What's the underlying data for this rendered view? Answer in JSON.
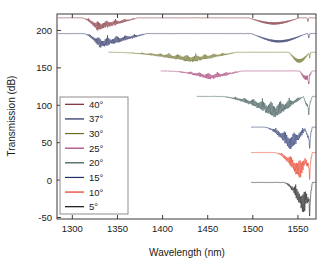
{
  "figure": {
    "background": "#ffffff",
    "frame_color": "#3a3a3a"
  },
  "chart_data": {
    "type": "line",
    "title": "",
    "xlabel": "Wavelength (nm)",
    "ylabel": "Transmission (dB)",
    "xlim": [
      1283,
      1570
    ],
    "ylim": [
      -52,
      222
    ],
    "xticks": [
      1300,
      1350,
      1400,
      1450,
      1500,
      1550
    ],
    "yticks": [
      -50,
      0,
      50,
      100,
      150,
      200
    ],
    "grid": false,
    "legend_position": "center-left",
    "series": [
      {
        "name": "40°",
        "label": "40°",
        "color": "#7a2630",
        "baseline_db": 217,
        "start_nm": 1284,
        "comb_start_nm": 1310,
        "comb_end_nm": 1372,
        "comb_peak_nm": 1327,
        "comb_depth_db": 15,
        "envelope_start_nm": 1495,
        "envelope_end_nm": 1552,
        "envelope_center_nm": 1524,
        "envelope_depth_db": 9,
        "bragg_nm": 1561,
        "bragg_depth_db": 5
      },
      {
        "name": "37°",
        "label": "37°",
        "color": "#20275c",
        "baseline_db": 196,
        "start_nm": 1284,
        "comb_start_nm": 1312,
        "comb_end_nm": 1382,
        "comb_peak_nm": 1330,
        "comb_depth_db": 17,
        "envelope_start_nm": 1498,
        "envelope_end_nm": 1560,
        "envelope_center_nm": 1535,
        "envelope_depth_db": 12,
        "bragg_nm": 1562,
        "bragg_depth_db": 6
      },
      {
        "name": "30°",
        "label": "30°",
        "color": "#6b6d23",
        "baseline_db": 171,
        "start_nm": 1340,
        "comb_start_nm": 1345,
        "comb_end_nm": 1482,
        "comb_peak_nm": 1432,
        "comb_depth_db": 12,
        "envelope_start_nm": 1540,
        "envelope_end_nm": 1563,
        "envelope_center_nm": 1556,
        "envelope_depth_db": 14,
        "bragg_nm": 1563,
        "bragg_depth_db": 8
      },
      {
        "name": "25°",
        "label": "25°",
        "color": "#a33a72",
        "baseline_db": 146,
        "start_nm": 1398,
        "comb_start_nm": 1404,
        "comb_end_nm": 1488,
        "comb_peak_nm": 1452,
        "comb_depth_db": 10,
        "envelope_start_nm": 1552,
        "envelope_end_nm": 1566,
        "envelope_center_nm": 1561,
        "envelope_depth_db": 12,
        "bragg_nm": 1562,
        "bragg_depth_db": 10
      },
      {
        "name": "20°",
        "label": "20°",
        "color": "#33514f",
        "baseline_db": 112,
        "start_nm": 1438,
        "comb_start_nm": 1462,
        "comb_end_nm": 1556,
        "comb_peak_nm": 1524,
        "comb_depth_db": 25,
        "envelope_start_nm": 1556,
        "envelope_end_nm": 1566,
        "envelope_center_nm": 1561,
        "envelope_depth_db": 14,
        "bragg_nm": 1562,
        "bragg_depth_db": 12
      },
      {
        "name": "15°",
        "label": "15°",
        "color": "#1f2f6b",
        "baseline_db": 71,
        "start_nm": 1498,
        "comb_start_nm": 1512,
        "comb_end_nm": 1560,
        "comb_peak_nm": 1542,
        "comb_depth_db": 28,
        "envelope_start_nm": 1558,
        "envelope_end_nm": 1566,
        "envelope_center_nm": 1562,
        "envelope_depth_db": 16,
        "bragg_nm": 1563,
        "bragg_depth_db": 14
      },
      {
        "name": "10°",
        "label": "10°",
        "color": "#e8341c",
        "baseline_db": 37,
        "start_nm": 1498,
        "comb_start_nm": 1524,
        "comb_end_nm": 1561,
        "comb_peak_nm": 1552,
        "comb_depth_db": 33,
        "envelope_start_nm": 1558,
        "envelope_end_nm": 1566,
        "envelope_center_nm": 1562,
        "envelope_depth_db": 20,
        "bragg_nm": 1563,
        "bragg_depth_db": 18
      },
      {
        "name": "5°",
        "label": "5°",
        "color": "#121212",
        "baseline_db": -3,
        "start_nm": 1498,
        "comb_start_nm": 1534,
        "comb_end_nm": 1562,
        "comb_peak_nm": 1557,
        "comb_depth_db": 40,
        "envelope_start_nm": 1559,
        "envelope_end_nm": 1566,
        "envelope_center_nm": 1562,
        "envelope_depth_db": 24,
        "bragg_nm": 1563,
        "bragg_depth_db": 22
      }
    ]
  }
}
